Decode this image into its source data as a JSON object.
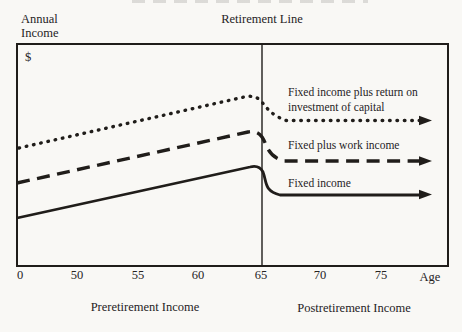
{
  "page": {
    "ink_color": "#201d1a",
    "paper_color": "#f9f8f5"
  },
  "header": {
    "y_axis_title": "Annual Income",
    "retirement_line_title": "Retirement Line",
    "dollar_sign": "$"
  },
  "chart_data": {
    "type": "line",
    "title": "",
    "xlabel": "Age",
    "ylabel": "Annual Income ($)",
    "x_tick_labels": [
      "0",
      "50",
      "55",
      "60",
      "65",
      "70",
      "75"
    ],
    "x_axis_end_label": "Age",
    "retirement_age": 65,
    "region_labels": {
      "left": "Preretirement Income",
      "right": "Postretirement Income"
    },
    "grid": "off",
    "legend_position": "inline annotations right of retirement line",
    "series": [
      {
        "name": "Fixed income plus return on investment of capital",
        "line_style": "dotted",
        "trend": "highest line; rises steadily until age 65, dips just after retirement, then constant to arrow"
      },
      {
        "name": "Fixed plus work income",
        "line_style": "dashed",
        "trend": "middle line; rises steadily until age 65, steps down at retirement, then constant to arrow"
      },
      {
        "name": "Fixed income",
        "line_style": "solid",
        "trend": "lowest line; rises steadily until age 65, steps down sharply at retirement, then constant to arrow"
      }
    ],
    "layout": {
      "frame_px": {
        "x": 17,
        "y": 44,
        "w": 431,
        "h": 222
      },
      "retirement_line_x_px": 262,
      "x_tick_x_px": [
        20,
        77,
        138,
        198,
        261,
        320,
        381
      ],
      "age_label_x_px": 430,
      "series_paths_px": [
        {
          "d": "M 19 148 L 244 97 Q 255 94.5 261 101 C 267 108 271 115 286 120.5 L 421 120.5",
          "arrow_tip_x": 432,
          "arrow_tip_y": 120.5
        },
        {
          "d": "M 17 183 L 248 132 Q 257 130 262 137 C 268 146 267 156 284 161 L 421 161",
          "arrow_tip_x": 432,
          "arrow_tip_y": 161
        },
        {
          "d": "M 17 218 L 250 167 Q 259 164.5 263 172 C 267 182.5 264 191 280 195 L 421 195",
          "arrow_tip_x": 432,
          "arrow_tip_y": 194.5
        }
      ]
    }
  }
}
